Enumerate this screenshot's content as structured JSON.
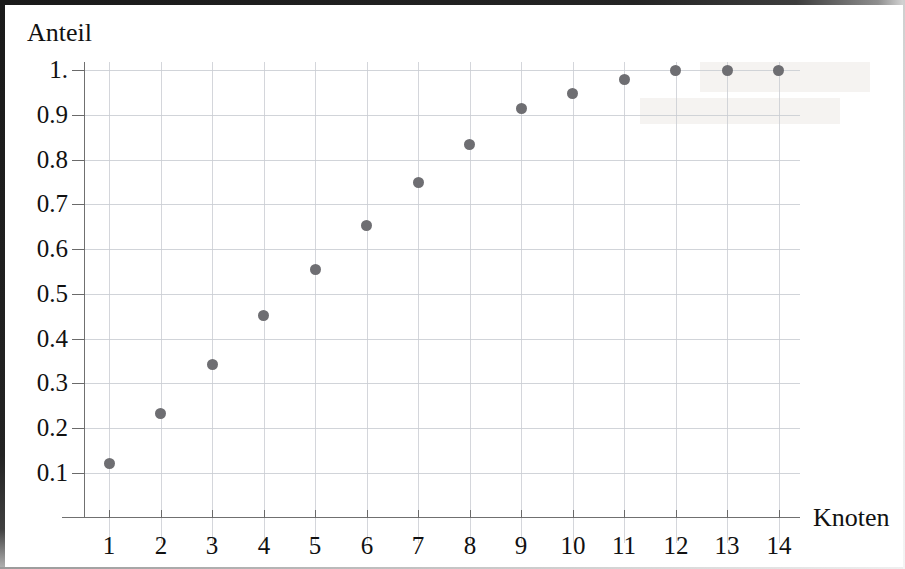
{
  "figure": {
    "background_color": "#ffffff",
    "frame_color": "#1a1a1a",
    "width": 905,
    "height": 569
  },
  "axes": {
    "y_axis_title": "Anteil",
    "x_axis_title": "Knoten",
    "marker_color": "#6e6e72",
    "grid_color": "#c9ccd2",
    "axis_color": "#707070"
  },
  "chart_data": {
    "type": "scatter",
    "title": "",
    "subtitle": "",
    "xlabel": "Knoten",
    "ylabel": "Anteil",
    "x": [
      1,
      2,
      3,
      4,
      5,
      6,
      7,
      8,
      9,
      10,
      11,
      12,
      13,
      14
    ],
    "values": [
      0.122,
      0.233,
      0.343,
      0.452,
      0.554,
      0.653,
      0.748,
      0.834,
      0.913,
      0.948,
      0.978,
      1.0,
      1.0,
      1.0
    ],
    "xtick_labels": [
      "1",
      "2",
      "3",
      "4",
      "5",
      "6",
      "7",
      "8",
      "9",
      "10",
      "11",
      "12",
      "13",
      "14"
    ],
    "ytick_labels": [
      "1.",
      "0.9",
      "0.8",
      "0.7",
      "0.6",
      "0.5",
      "0.4",
      "0.3",
      "0.2",
      "0.1"
    ],
    "ytick_values": [
      1.0,
      0.9,
      0.8,
      0.7,
      0.6,
      0.5,
      0.4,
      0.3,
      0.2,
      0.1
    ],
    "xlim": [
      0.45,
      14.55
    ],
    "ylim": [
      0.0,
      1.06
    ],
    "grid": true,
    "legend": "none",
    "marker_style": "filled-circle",
    "annotations": []
  }
}
